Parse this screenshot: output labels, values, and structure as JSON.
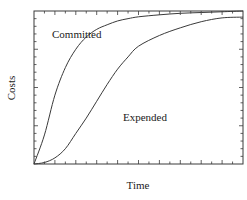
{
  "chart_data": {
    "type": "line",
    "title": "",
    "xlabel": "Time",
    "ylabel": "Costs",
    "xlim": [
      0,
      1
    ],
    "ylim": [
      0,
      1
    ],
    "grid": false,
    "legend": "inline annotations",
    "x_ticks": "20 unlabeled subdivisions (major every 2)",
    "y_ticks": "20 unlabeled subdivisions (major every 5)",
    "x": [
      0,
      0.05,
      0.1,
      0.15,
      0.2,
      0.25,
      0.3,
      0.35,
      0.4,
      0.45,
      0.5,
      0.6,
      0.7,
      0.8,
      0.9,
      1.0
    ],
    "series": [
      {
        "name": "Committed",
        "values": [
          0,
          0.19,
          0.45,
          0.63,
          0.75,
          0.83,
          0.88,
          0.91,
          0.935,
          0.95,
          0.962,
          0.975,
          0.985,
          0.99,
          0.995,
          1.0
        ]
      },
      {
        "name": "Expended",
        "values": [
          0,
          0.01,
          0.04,
          0.1,
          0.2,
          0.3,
          0.41,
          0.52,
          0.62,
          0.7,
          0.77,
          0.84,
          0.89,
          0.93,
          0.955,
          0.96
        ]
      }
    ],
    "annotations": [
      {
        "text": "Committed",
        "near": "upper-left, above Committed curve"
      },
      {
        "text": "Expended",
        "near": "center-right, below Expended curve"
      }
    ]
  },
  "labels": {
    "x_axis": "Time",
    "y_axis": "Costs",
    "committed": "Committed",
    "expended": "Expended"
  },
  "colors": {
    "line": "#3a3a3a",
    "frame": "#3a3a3a",
    "text": "#1a1a1a",
    "background": "#ffffff"
  }
}
